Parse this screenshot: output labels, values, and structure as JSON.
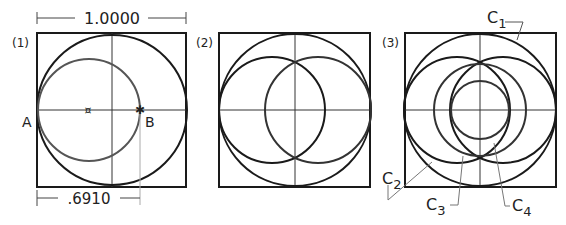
{
  "panels": [
    {
      "label": "(1)",
      "points": {
        "A": "A",
        "B": "B"
      },
      "dimensions": {
        "top": "1.0000",
        "bottom": ".6910"
      }
    },
    {
      "label": "(2)"
    },
    {
      "label": "(3)",
      "callouts": {
        "c1": "C",
        "c1_sub": "1",
        "c2": "C",
        "c2_sub": "2",
        "c3": "C",
        "c3_sub": "3",
        "c4": "C",
        "c4_sub": "4"
      }
    }
  ],
  "colors": {
    "stroke": "#1a1a1a",
    "gray": "#555555",
    "construction": "#999999"
  }
}
